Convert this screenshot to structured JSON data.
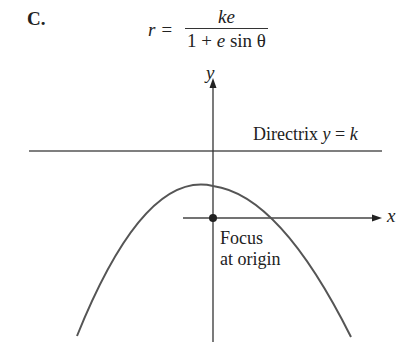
{
  "figure": {
    "label": "C.",
    "equation": {
      "lhs": "r =",
      "numerator": "ke",
      "denominator_prefix": "1 + ",
      "denominator_var": "e",
      "denominator_suffix": " sin θ"
    },
    "axes": {
      "x_label": "x",
      "y_label": "y"
    },
    "directrix": {
      "text": "Directrix ",
      "eq_var": "y",
      "eq_rest": " = ",
      "eq_k": "k"
    },
    "focus": {
      "line1": "Focus",
      "line2": "at origin"
    },
    "colors": {
      "stroke": "#444444",
      "curve": "#555555",
      "background": "#ffffff"
    }
  }
}
